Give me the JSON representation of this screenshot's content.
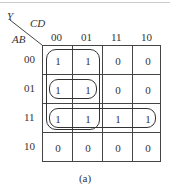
{
  "kmap": {
    "output_label": "Y",
    "col_var": "CD",
    "row_var": "AB",
    "col_labels": [
      "00",
      "01",
      "11",
      "10"
    ],
    "row_labels": [
      "00",
      "01",
      "11",
      "10"
    ],
    "cells": [
      [
        "1",
        "1",
        "0",
        "0"
      ],
      [
        "1",
        "1",
        "0",
        "0"
      ],
      [
        "1",
        "1",
        "1",
        "1"
      ],
      [
        "0",
        "0",
        "0",
        "0"
      ]
    ],
    "groups": [
      {
        "name": "group-rows-00-01-11-cols-00-01"
      },
      {
        "name": "group-row-01-cols-00-01"
      },
      {
        "name": "group-row-11-all-cols"
      }
    ]
  },
  "caption": "(a)"
}
